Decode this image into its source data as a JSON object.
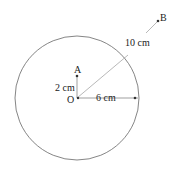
{
  "diagram": {
    "points": {
      "O": {
        "label": "O"
      },
      "A": {
        "label": "A"
      },
      "B": {
        "label": "B"
      }
    },
    "measurements": {
      "OA": "2 cm",
      "radius": "6 cm",
      "OB": "10 cm"
    },
    "colors": {
      "stroke": "#555555",
      "text": "#222222"
    }
  }
}
